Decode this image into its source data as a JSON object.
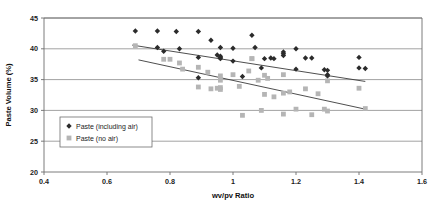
{
  "chart_data": {
    "type": "scatter",
    "title": "",
    "xlabel": "wv/pv Ratio",
    "ylabel": "Paste Volume (%)",
    "xlim": [
      0.4,
      1.6
    ],
    "ylim": [
      20,
      45
    ],
    "xticks": [
      "0.4",
      "0.6",
      "0.8",
      "1",
      "1.2",
      "1.4",
      "1.6"
    ],
    "xtick_values": [
      0.4,
      0.6,
      0.8,
      1.0,
      1.2,
      1.4,
      1.6
    ],
    "yticks": [
      "20",
      "25",
      "30",
      "35",
      "40",
      "45"
    ],
    "ytick_values": [
      20,
      25,
      30,
      35,
      40,
      45
    ],
    "grid": "horizontal",
    "legend_position": "bottom-left",
    "series": [
      {
        "name": "Paste (including air)",
        "marker": "diamond",
        "color": "#2b2b2b",
        "points": [
          [
            0.69,
            42.9
          ],
          [
            0.76,
            40.2
          ],
          [
            0.78,
            39.6
          ],
          [
            0.76,
            42.9
          ],
          [
            0.82,
            42.8
          ],
          [
            0.83,
            40.0
          ],
          [
            0.89,
            42.8
          ],
          [
            0.89,
            38.6
          ],
          [
            0.89,
            35.3
          ],
          [
            0.93,
            41.4
          ],
          [
            0.95,
            39.0
          ],
          [
            0.96,
            38.8
          ],
          [
            0.96,
            38.6
          ],
          [
            0.96,
            38.4
          ],
          [
            0.96,
            40.2
          ],
          [
            1.0,
            40.1
          ],
          [
            1.0,
            38.0
          ],
          [
            1.03,
            35.5
          ],
          [
            1.06,
            42.2
          ],
          [
            1.07,
            40.2
          ],
          [
            1.09,
            36.9
          ],
          [
            1.1,
            38.4
          ],
          [
            1.12,
            38.5
          ],
          [
            1.13,
            38.4
          ],
          [
            1.16,
            39.5
          ],
          [
            1.16,
            39.2
          ],
          [
            1.16,
            38.9
          ],
          [
            1.2,
            40.0
          ],
          [
            1.2,
            36.7
          ],
          [
            1.23,
            38.5
          ],
          [
            1.25,
            38.5
          ],
          [
            1.29,
            36.6
          ],
          [
            1.3,
            36.5
          ],
          [
            1.3,
            35.8
          ],
          [
            1.3,
            35.6
          ],
          [
            1.4,
            38.6
          ],
          [
            1.4,
            36.9
          ],
          [
            1.42,
            36.8
          ]
        ]
      },
      {
        "name": "Paste (no air)",
        "marker": "square",
        "color": "#b5b5b5",
        "points": [
          [
            0.69,
            40.5
          ],
          [
            0.78,
            38.3
          ],
          [
            0.8,
            38.3
          ],
          [
            0.83,
            37.7
          ],
          [
            0.84,
            36.7
          ],
          [
            0.89,
            33.8
          ],
          [
            0.89,
            37.0
          ],
          [
            0.92,
            36.2
          ],
          [
            0.93,
            33.5
          ],
          [
            0.95,
            33.6
          ],
          [
            0.96,
            33.7
          ],
          [
            0.96,
            33.4
          ],
          [
            0.96,
            35.6
          ],
          [
            0.96,
            34.9
          ],
          [
            1.0,
            35.8
          ],
          [
            1.02,
            33.9
          ],
          [
            1.03,
            29.2
          ],
          [
            1.05,
            36.4
          ],
          [
            1.06,
            38.4
          ],
          [
            1.06,
            38.4
          ],
          [
            1.08,
            34.9
          ],
          [
            1.09,
            30.0
          ],
          [
            1.1,
            35.7
          ],
          [
            1.1,
            32.6
          ],
          [
            1.11,
            35.2
          ],
          [
            1.13,
            32.2
          ],
          [
            1.16,
            35.8
          ],
          [
            1.16,
            32.8
          ],
          [
            1.16,
            29.4
          ],
          [
            1.18,
            33.0
          ],
          [
            1.2,
            30.2
          ],
          [
            1.23,
            33.5
          ],
          [
            1.25,
            29.3
          ],
          [
            1.27,
            32.7
          ],
          [
            1.29,
            30.2
          ],
          [
            1.3,
            29.9
          ],
          [
            1.3,
            34.8
          ],
          [
            1.4,
            33.6
          ],
          [
            1.42,
            30.3
          ]
        ]
      }
    ],
    "trendlines": [
      {
        "name": "trend-including-air",
        "series": "Paste (including air)",
        "x0": 0.68,
        "y0": 40.6,
        "x1": 1.42,
        "y1": 34.7
      },
      {
        "name": "trend-no-air",
        "series": "Paste (no air)",
        "x0": 0.7,
        "y0": 38.2,
        "x1": 1.42,
        "y1": 30.2
      }
    ]
  }
}
